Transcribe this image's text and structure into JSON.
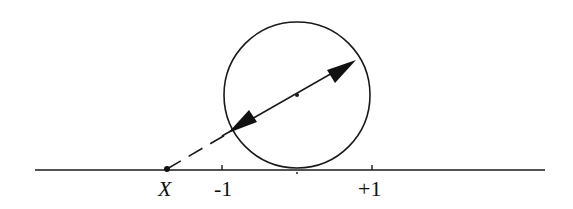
{
  "diagram": {
    "colors": {
      "stroke": "#1a1a1a",
      "background": "#ffffff"
    },
    "axis": {
      "x1": 35,
      "x2": 545,
      "y": 170
    },
    "circle": {
      "cx": 297,
      "cy": 95,
      "r": 73
    },
    "points": {
      "X": {
        "x": 167,
        "y": 169
      },
      "center": {
        "x": 297,
        "y": 95
      }
    },
    "ticks": [
      {
        "name": "minus-one",
        "x": 222
      },
      {
        "name": "zero",
        "x": 297
      },
      {
        "name": "plus-one",
        "x": 372
      }
    ],
    "labels": {
      "X": "X",
      "minus_one": "-1",
      "plus_one": "+1"
    },
    "arrow": {
      "tip_upper": {
        "x": 356,
        "y": 60
      },
      "tip_lower": {
        "x": 231,
        "y": 131
      }
    },
    "dashed_segment": {
      "from": {
        "x": 167,
        "y": 169
      },
      "to": {
        "x": 232,
        "y": 131
      }
    }
  }
}
